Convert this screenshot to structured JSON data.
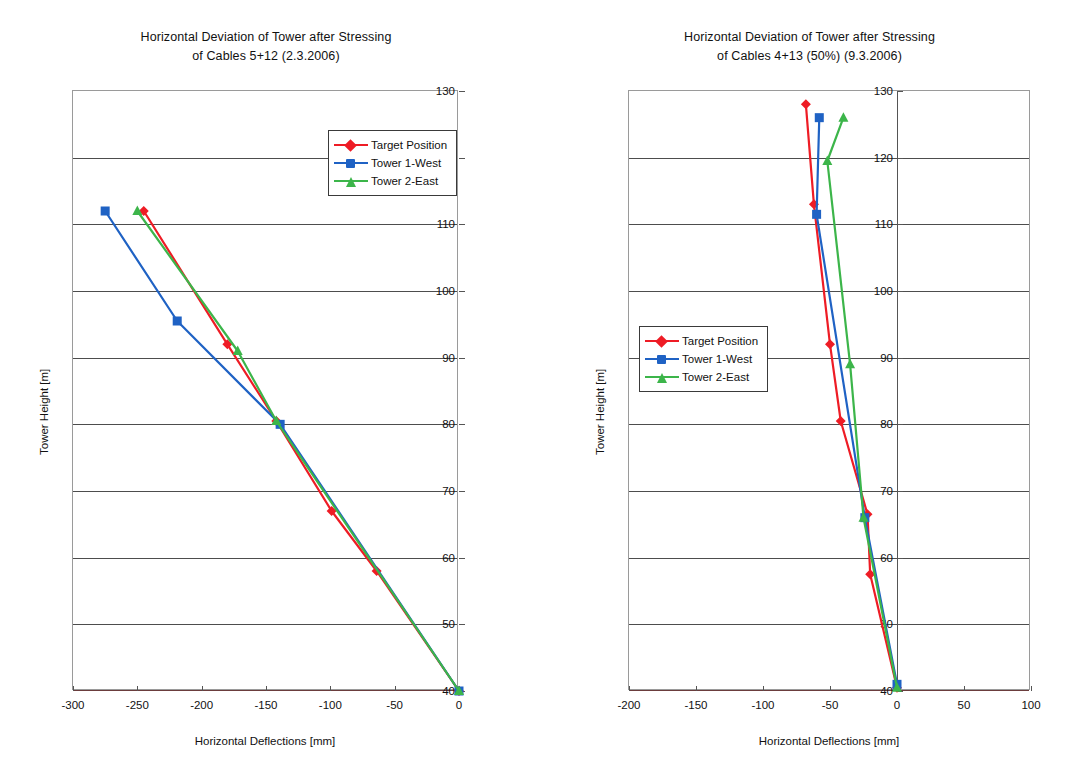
{
  "figure": {
    "axis_x_title": "Horizontal Deflections [mm]",
    "axis_y_title": "Tower Height [m]"
  },
  "legend": {
    "items": [
      {
        "label": "Target Position",
        "color": "#ee1c25",
        "marker": "diamond"
      },
      {
        "label": "Tower 1-West",
        "color": "#1f62c4",
        "marker": "square"
      },
      {
        "label": "Tower 2-East",
        "color": "#3cb54a",
        "marker": "triangle"
      }
    ]
  },
  "chart_data": [
    {
      "id": "left",
      "type": "line",
      "title": "Horizontal Deviation of Tower after Stressing of Cables 5+12 (2.3.2006)",
      "title_line1": "Horizontal Deviation of Tower after Stressing",
      "title_line2": "of Cables 5+12 (2.3.2006)",
      "xlabel": "Horizontal Deflections [mm]",
      "ylabel": "Tower Height [m]",
      "xlim": [
        -300,
        0
      ],
      "ylim": [
        40,
        130
      ],
      "xticks": [
        -300,
        -250,
        -200,
        -150,
        -100,
        -50,
        0
      ],
      "yticks": [
        40,
        50,
        60,
        70,
        80,
        90,
        100,
        110,
        120,
        130
      ],
      "ytick_side": "right",
      "grid": "horizontal",
      "legend_position": "top-right-inside",
      "series": [
        {
          "name": "Target Position",
          "color": "#ee1c25",
          "marker": "diamond",
          "x": [
            0,
            -64,
            -99,
            -142,
            -180,
            -245
          ],
          "y": [
            40,
            58,
            67,
            80.5,
            92,
            112
          ]
        },
        {
          "name": "Tower 1-West",
          "color": "#1f62c4",
          "marker": "square",
          "x": [
            0,
            -139,
            -219,
            -275
          ],
          "y": [
            40,
            80,
            95.5,
            112
          ]
        },
        {
          "name": "Tower 2-East",
          "color": "#3cb54a",
          "marker": "triangle",
          "x": [
            0,
            -142,
            -172,
            -250
          ],
          "y": [
            40,
            80.5,
            91,
            112
          ]
        }
      ]
    },
    {
      "id": "right",
      "type": "line",
      "title": "Horizontal Deviation of Tower after Stressing of Cables 4+13 (50%) (9.3.2006)",
      "title_line1": "Horizontal Deviation of Tower after Stressing",
      "title_line2": "of Cables 4+13 (50%) (9.3.2006)",
      "xlabel": "Horizontal Deflections [mm]",
      "ylabel": "Tower Height [m]",
      "xlim": [
        -200,
        100
      ],
      "ylim": [
        40,
        130
      ],
      "xticks": [
        -200,
        -150,
        -100,
        -50,
        0,
        50,
        100
      ],
      "yticks": [
        40,
        50,
        60,
        70,
        80,
        90,
        100,
        110,
        120,
        130
      ],
      "ytick_side": "at-zero",
      "grid": "horizontal",
      "legend_position": "middle-left-inside",
      "series": [
        {
          "name": "Target Position",
          "color": "#ee1c25",
          "marker": "diamond",
          "x": [
            0,
            -20,
            -22,
            -42,
            -50,
            -62,
            -68
          ],
          "y": [
            40.5,
            57.5,
            66.5,
            80.5,
            92,
            113,
            128
          ]
        },
        {
          "name": "Tower 1-West",
          "color": "#1f62c4",
          "marker": "square",
          "x": [
            0,
            -24,
            -60,
            -58
          ],
          "y": [
            41,
            66,
            111.5,
            126
          ]
        },
        {
          "name": "Tower 2-East",
          "color": "#3cb54a",
          "marker": "triangle",
          "x": [
            0,
            -25,
            -35,
            -52,
            -40
          ],
          "y": [
            40.5,
            66,
            89,
            119.5,
            126
          ]
        }
      ]
    }
  ]
}
